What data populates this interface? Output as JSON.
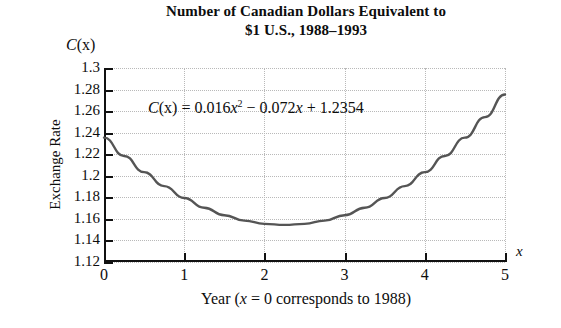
{
  "title": {
    "line1": "Number of Canadian Dollars Equivalent to",
    "line2": "$1 U.S., 1988–1993"
  },
  "axes": {
    "y_symbol_var": "C",
    "y_symbol_arg": "(x)",
    "y_title": "Exchange Rate",
    "x_symbol": "x",
    "x_title_prefix": "Year (",
    "x_title_var": "x",
    "x_title_suffix": " = 0 corresponds to 1988)"
  },
  "equation": {
    "lhs_var": "C",
    "lhs_arg": "(x)",
    "eq": " = 0.016",
    "term1_var": "x",
    "term1_exp": "2",
    "op1": " − 0.072",
    "term2_var": "x",
    "op2": " + 1.2354",
    "full": "C(x) = 0.016x² − 0.072x + 1.2354"
  },
  "colors": {
    "curve": "#555555",
    "axis": "#111111",
    "grid": "#b9b9b9",
    "text": "#0d0d0d",
    "background": "#ffffff"
  },
  "chart_data": {
    "type": "line",
    "title": "Number of Canadian Dollars Equivalent to $1 U.S., 1988–1993",
    "xlabel": "Year (x = 0 corresponds to 1988)",
    "ylabel": "Exchange Rate",
    "xlim": [
      0,
      5
    ],
    "ylim": [
      1.12,
      1.3
    ],
    "xticks": [
      0,
      1,
      2,
      3,
      4,
      5
    ],
    "xtick_labels": [
      "0",
      "1",
      "2",
      "3",
      "4",
      "5"
    ],
    "yticks": [
      1.12,
      1.14,
      1.16,
      1.18,
      1.2,
      1.22,
      1.24,
      1.26,
      1.28,
      1.3
    ],
    "ytick_labels": [
      "1.12",
      "1.14",
      "1.16",
      "1.18",
      "1.2",
      "1.22",
      "1.24",
      "1.26",
      "1.28",
      "1.3"
    ],
    "grid": true,
    "legend": null,
    "annotations": [
      "C(x) = 0.016x² − 0.072x + 1.2354"
    ],
    "equation_coefficients": {
      "a": 0.016,
      "b": -0.072,
      "c": 1.2354
    },
    "vertex": {
      "x": 2.25,
      "y": 1.1544
    },
    "series": [
      {
        "name": "C(x) = 0.016x² − 0.072x + 1.2354",
        "x": [
          0,
          0.25,
          0.5,
          0.75,
          1,
          1.25,
          1.5,
          1.75,
          2,
          2.25,
          2.5,
          2.75,
          3,
          3.25,
          3.5,
          3.75,
          4,
          4.25,
          4.5,
          4.75,
          5
        ],
        "values": [
          1.2354,
          1.2184,
          1.2034,
          1.1904,
          1.1794,
          1.1704,
          1.1634,
          1.1584,
          1.1554,
          1.1544,
          1.1554,
          1.1584,
          1.1634,
          1.1704,
          1.1794,
          1.1904,
          1.2034,
          1.2184,
          1.2354,
          1.2544,
          1.2754
        ]
      }
    ]
  }
}
